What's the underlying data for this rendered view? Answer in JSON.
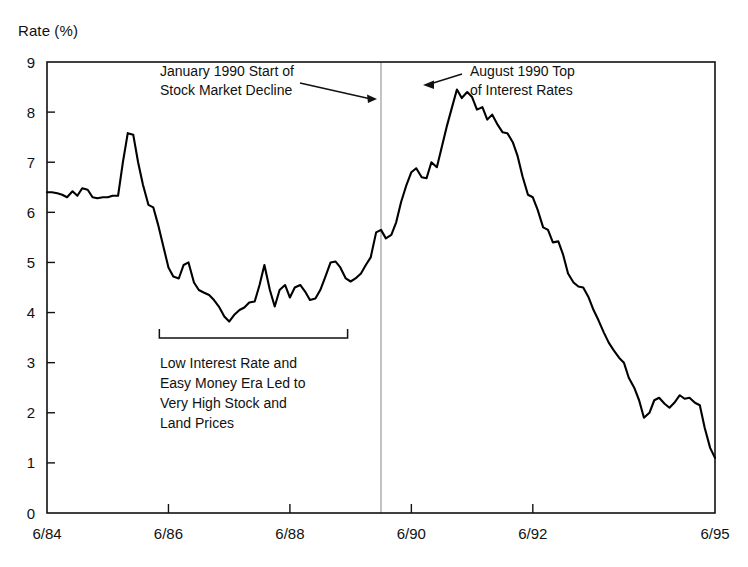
{
  "chart_data": {
    "type": "line",
    "title": "",
    "ylabel": "Rate (%)",
    "xlabel": "",
    "ylim": [
      0,
      9
    ],
    "xlim": [
      "6/84",
      "6/95"
    ],
    "grid": false,
    "legend": "none",
    "y_ticks": [
      "0",
      "1",
      "2",
      "3",
      "4",
      "5",
      "6",
      "7",
      "8",
      "9"
    ],
    "x_ticks": [
      "6/84",
      "6/86",
      "6/88",
      "6/90",
      "6/92",
      "6/95"
    ],
    "x_tick_values": [
      1984.5,
      1986.5,
      1988.5,
      1990.5,
      1992.5,
      1995.5
    ],
    "series": [
      {
        "name": "Interest Rate",
        "x": [
          1984.5,
          1984.58,
          1984.67,
          1984.75,
          1984.83,
          1984.92,
          1985.0,
          1985.08,
          1985.17,
          1985.25,
          1985.33,
          1985.42,
          1985.5,
          1985.58,
          1985.67,
          1985.75,
          1985.83,
          1985.92,
          1986.0,
          1986.08,
          1986.17,
          1986.25,
          1986.33,
          1986.42,
          1986.5,
          1986.58,
          1986.67,
          1986.75,
          1986.83,
          1986.92,
          1987.0,
          1987.08,
          1987.17,
          1987.25,
          1987.33,
          1987.42,
          1987.5,
          1987.58,
          1987.67,
          1987.75,
          1987.83,
          1987.92,
          1988.0,
          1988.08,
          1988.17,
          1988.25,
          1988.33,
          1988.42,
          1988.5,
          1988.58,
          1988.67,
          1988.75,
          1988.83,
          1988.92,
          1989.0,
          1989.08,
          1989.17,
          1989.25,
          1989.33,
          1989.42,
          1989.5,
          1989.58,
          1989.67,
          1989.75,
          1989.83,
          1989.92,
          1990.0,
          1990.08,
          1990.17,
          1990.25,
          1990.33,
          1990.42,
          1990.5,
          1990.58,
          1990.67,
          1990.75,
          1990.83,
          1990.92,
          1991.0,
          1991.08,
          1991.17,
          1991.25,
          1991.33,
          1991.42,
          1991.5,
          1991.58,
          1991.67,
          1991.75,
          1991.83,
          1991.92,
          1992.0,
          1992.08,
          1992.17,
          1992.25,
          1992.33,
          1992.42,
          1992.5,
          1992.58,
          1992.67,
          1992.75,
          1992.83,
          1992.92,
          1993.0,
          1993.08,
          1993.17,
          1993.25,
          1993.33,
          1993.42,
          1993.5,
          1993.58,
          1993.67,
          1993.75,
          1993.83,
          1993.92,
          1994.0,
          1994.08,
          1994.17,
          1994.25,
          1994.33,
          1994.42,
          1994.5,
          1994.58,
          1994.67,
          1994.75,
          1994.83,
          1994.92,
          1995.0,
          1995.08,
          1995.17,
          1995.25,
          1995.33,
          1995.42,
          1995.5
        ],
        "y": [
          6.4,
          6.4,
          6.38,
          6.35,
          6.3,
          6.42,
          6.33,
          6.48,
          6.45,
          6.3,
          6.28,
          6.3,
          6.3,
          6.33,
          6.33,
          7.0,
          7.58,
          7.55,
          7.0,
          6.55,
          6.15,
          6.1,
          5.75,
          5.3,
          4.9,
          4.72,
          4.68,
          4.95,
          5.0,
          4.6,
          4.45,
          4.4,
          4.35,
          4.25,
          4.12,
          3.92,
          3.82,
          3.95,
          4.05,
          4.1,
          4.2,
          4.22,
          4.55,
          4.95,
          4.45,
          4.12,
          4.45,
          4.55,
          4.3,
          4.5,
          4.55,
          4.42,
          4.25,
          4.28,
          4.45,
          4.7,
          5.0,
          5.02,
          4.9,
          4.68,
          4.62,
          4.68,
          4.78,
          4.95,
          5.1,
          5.6,
          5.65,
          5.48,
          5.55,
          5.8,
          6.2,
          6.55,
          6.8,
          6.88,
          6.7,
          6.68,
          7.0,
          6.9,
          7.3,
          7.7,
          8.1,
          8.45,
          8.28,
          8.4,
          8.3,
          8.05,
          8.1,
          7.85,
          7.95,
          7.75,
          7.6,
          7.58,
          7.4,
          7.12,
          6.72,
          6.35,
          6.3,
          6.05,
          5.7,
          5.65,
          5.4,
          5.42,
          5.15,
          4.78,
          4.6,
          4.52,
          4.5,
          4.3,
          4.05,
          3.85,
          3.6,
          3.4,
          3.25,
          3.1,
          3.0,
          2.7,
          2.5,
          2.25,
          1.9,
          2.0,
          2.25,
          2.3,
          2.18,
          2.1,
          2.2,
          2.35,
          2.28,
          2.3,
          2.2,
          2.15,
          1.7,
          1.3,
          1.1
        ]
      }
    ],
    "annotations": [
      {
        "name": "january-1990-annotation",
        "lines": [
          "January 1990 Start of",
          "Stock Market Decline"
        ],
        "target_x": 1990.0,
        "arrow": "right"
      },
      {
        "name": "august-1990-annotation",
        "lines": [
          "August 1990 Top",
          "of Interest Rates"
        ],
        "target_x": 1990.6,
        "target_y": 8.45,
        "arrow": "left"
      },
      {
        "name": "low-rate-era-annotation",
        "lines": [
          "Low Interest Rate and",
          "Easy Money Era Led to",
          "Very High Stock and",
          "Land Prices"
        ],
        "bracket_start_x": 1986.35,
        "bracket_end_x": 1989.45
      }
    ],
    "reference_line": {
      "name": "january-1990-line",
      "x": 1990.0,
      "color": "#9a9a9a"
    },
    "colors": {
      "series": "#000000",
      "axis": "#111111",
      "reference_line": "#9a9a9a",
      "background": "#ffffff"
    }
  }
}
